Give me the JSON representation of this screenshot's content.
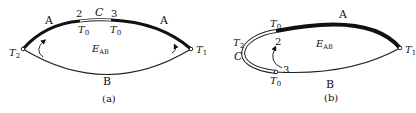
{
  "panels": [
    {
      "id": "a",
      "caption": "(a)",
      "region_label": "E",
      "region_sub": "AB",
      "labels": {
        "arc_top_left": "A",
        "arc_top_right": "A",
        "arc_bottom": "B",
        "segment": "C",
        "point_2": "2",
        "point_3": "3",
        "t0_left": "T",
        "t0_left_sub": "0",
        "t0_right": "T",
        "t0_right_sub": "0",
        "t1": "T",
        "t1_sub": "1",
        "t2": "T",
        "t2_sub": "2"
      }
    },
    {
      "id": "b",
      "caption": "(b)",
      "region_label": "E",
      "region_sub": "AB",
      "labels": {
        "arc_top": "A",
        "arc_bottom": "B",
        "segment": "C",
        "point_2": "2",
        "point_3": "3",
        "t0_top": "T",
        "t0_top_sub": "0",
        "t0_bottom": "T",
        "t0_bottom_sub": "0",
        "t1": "T",
        "t1_sub": "1",
        "t2": "T",
        "t2_sub": "2"
      }
    }
  ]
}
